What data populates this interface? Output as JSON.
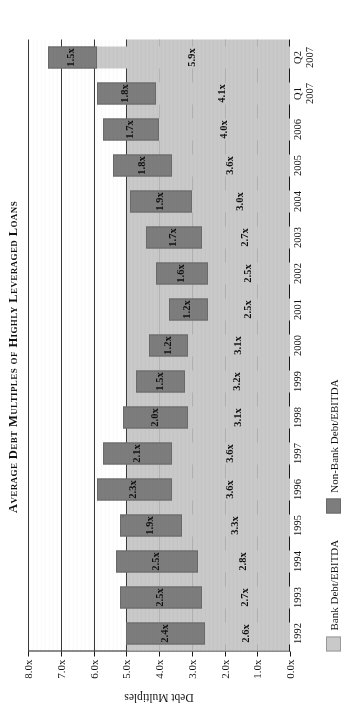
{
  "title": "Average Debt Multiples of Highly Leveraged Loans",
  "axis": {
    "y_title": "Debt Multiples",
    "y_ticks": [
      "8.0x",
      "7.0x",
      "6.0x",
      "5.0x",
      "4.0x",
      "3.0x",
      "2.0x",
      "1.0x",
      "0.0x"
    ]
  },
  "legend": {
    "bank_label": "Bank Debt/EBITDA",
    "nonbank_label": "Non-Bank Debt/EBITDA",
    "bank_color": "#c9c9c9",
    "nonbank_color": "#7d7d7d"
  },
  "chart_data": {
    "type": "bar",
    "title": "Average Debt Multiples of Highly Leveraged Loans",
    "xlabel": "",
    "ylabel": "Debt Multiples",
    "ylim": [
      0,
      8
    ],
    "ytick_values": [
      8,
      7,
      6,
      5,
      4,
      3,
      2,
      1,
      0
    ],
    "ytick_labels": [
      "8.0x",
      "7.0x",
      "6.0x",
      "5.0x",
      "4.0x",
      "3.0x",
      "2.0x",
      "1.0x",
      "0.0x"
    ],
    "grid": true,
    "stacked": true,
    "legend_position": "bottom-left",
    "categories": [
      "1992",
      "1993",
      "1994",
      "1995",
      "1996",
      "1997",
      "1998",
      "1999",
      "2000",
      "2001",
      "2002",
      "2003",
      "2004",
      "2005",
      "2006",
      "Q1 2007",
      "Q2 2007"
    ],
    "category_sublabels": [
      "",
      "",
      "",
      "",
      "",
      "",
      "",
      "",
      "",
      "",
      "",
      "",
      "",
      "",
      "",
      "2007",
      "2007"
    ],
    "series": [
      {
        "name": "Bank Debt/EBITDA",
        "color": "#c9c9c9",
        "values": [
          2.6,
          2.7,
          2.8,
          3.3,
          3.6,
          3.6,
          3.1,
          3.2,
          3.1,
          2.5,
          2.5,
          2.7,
          3.0,
          3.6,
          4.0,
          4.1,
          5.9
        ],
        "labels": [
          "2.6x",
          "2.7x",
          "2.8x",
          "3.3x",
          "3.6x",
          "3.6x",
          "3.1x",
          "3.2x",
          "3.1x",
          "2.5x",
          "2.5x",
          "2.7x",
          "3.0x",
          "3.6x",
          "4.0x",
          "4.1x",
          "5.9x"
        ]
      },
      {
        "name": "Non-Bank Debt/EBITDA",
        "color": "#7d7d7d",
        "values": [
          2.4,
          2.5,
          2.5,
          1.9,
          2.3,
          2.1,
          2.0,
          1.5,
          1.2,
          1.2,
          1.6,
          1.7,
          1.9,
          1.8,
          1.7,
          1.8,
          1.5
        ],
        "labels": [
          "2.4x",
          "2.5x",
          "2.5x",
          "1.9x",
          "2.3x",
          "2.1x",
          "2.0x",
          "1.5x",
          "1.2x",
          "1.2x",
          "1.6x",
          "1.7x",
          "1.9x",
          "1.8x",
          "1.7x",
          "1.8x",
          "1.5x"
        ]
      }
    ],
    "totals": [
      5.0,
      5.2,
      5.3,
      5.2,
      5.9,
      5.7,
      5.1,
      4.7,
      4.3,
      3.7,
      4.1,
      4.4,
      4.9,
      5.4,
      5.7,
      5.9,
      7.4
    ]
  }
}
